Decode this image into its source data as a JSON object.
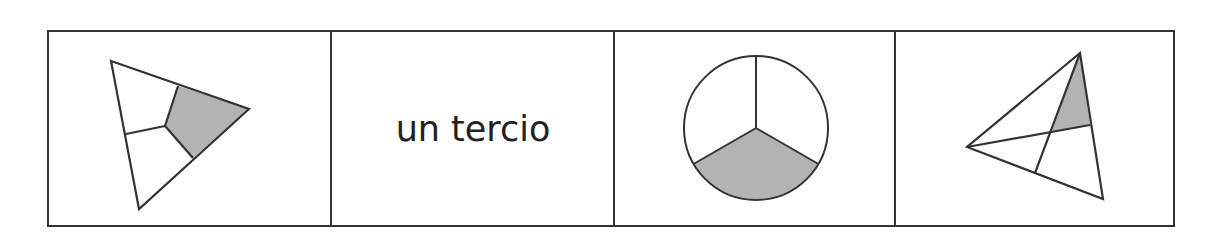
{
  "worksheet": {
    "panels": [
      {
        "type": "figure",
        "shape": "triangle",
        "divided_into": 3,
        "shaded_parts": 1,
        "division": "kite regions from center to side midpoints"
      },
      {
        "type": "text",
        "label": "un tercio"
      },
      {
        "type": "figure",
        "shape": "circle",
        "divided_into": 3,
        "shaded_parts": 1,
        "division": "three equal sectors"
      },
      {
        "type": "figure",
        "shape": "triangle",
        "divided_into": "unequal",
        "shaded_parts": 1,
        "division": "two medians crossing"
      }
    ]
  },
  "colors": {
    "stroke": "#333333",
    "shade": "#b3b3b3",
    "text": "#222222",
    "background": "#ffffff"
  }
}
